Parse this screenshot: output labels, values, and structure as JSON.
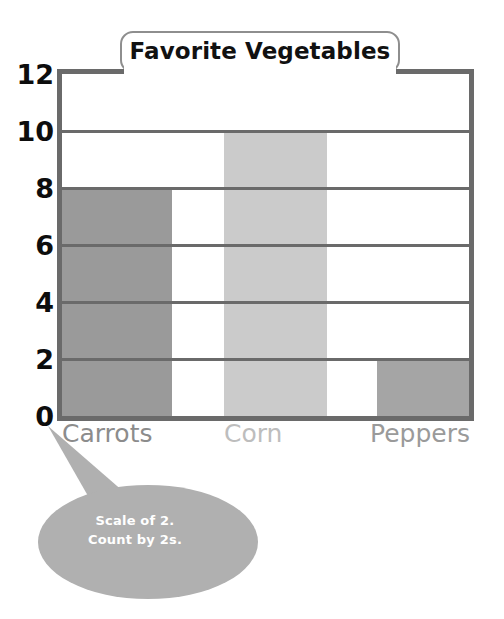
{
  "chart_data": {
    "type": "bar",
    "title": "Favorite Vegetables",
    "categories": [
      "Carrots",
      "Corn",
      "Peppers"
    ],
    "values": [
      8,
      10,
      2
    ],
    "xlabel": "",
    "ylabel": "",
    "ylim": [
      0,
      12
    ],
    "y_ticks": [
      12,
      10,
      8,
      6,
      4,
      2,
      0
    ],
    "tick_step": 2,
    "grid": true,
    "legend": "none",
    "series": [
      {
        "name": "Favorite Vegetables",
        "values": [
          8,
          10,
          2
        ]
      }
    ],
    "bar_colors": [
      "#9a9a9a",
      "#cbcbcb",
      "#a5a5a5"
    ],
    "annotations": [
      {
        "id": "scale-callout",
        "lines": [
          "Scale of 2.",
          "Count by 2s."
        ],
        "points_to": "0"
      }
    ]
  },
  "chart": {
    "title": "Favorite Vegetables",
    "y_axis": {
      "ticks": [
        "12",
        "10",
        "8",
        "6",
        "4",
        "2",
        "0"
      ]
    },
    "bars": [
      {
        "label": "Carrots",
        "value": 8,
        "color": "#9a9a9a",
        "label_color": "#8c8c8c"
      },
      {
        "label": "Corn",
        "value": 10,
        "color": "#cbcbcb",
        "label_color": "#bdbdbd"
      },
      {
        "label": "Peppers",
        "value": 2,
        "color": "#a5a5a5",
        "label_color": "#9a9a9a"
      }
    ],
    "callout": {
      "line1": "Scale of 2.",
      "line2": "Count by 2s.",
      "fill": "#b0b0b0"
    },
    "colors": {
      "frame": "#6a6a6a",
      "grid": "#6a6a6a",
      "title_border": "#8e8e8e",
      "title_text": "#111111",
      "tick_text": "#0d0d0d",
      "background": "#ffffff"
    }
  }
}
